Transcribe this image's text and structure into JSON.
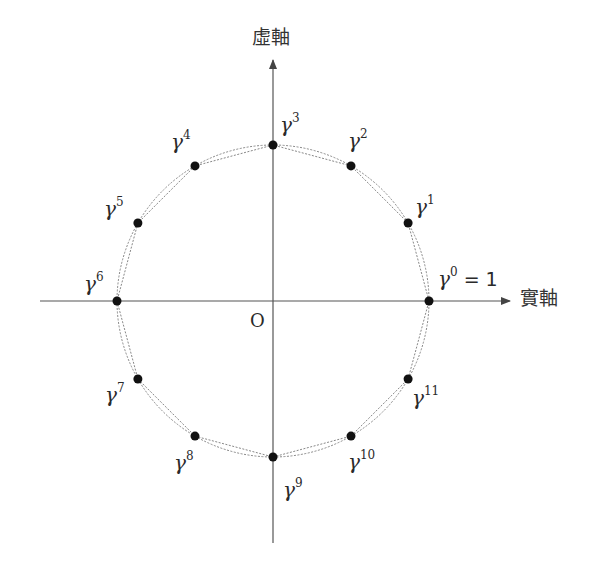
{
  "diagram": {
    "axes": {
      "imaginary_label": "虛軸",
      "real_label": "實軸",
      "origin_label": "O"
    },
    "circle": {
      "center_px": [
        273,
        301
      ],
      "radius_px": 156
    },
    "points": [
      {
        "base": "γ",
        "exp": "0",
        "suffix": " = 1",
        "angle_deg": 0
      },
      {
        "base": "γ",
        "exp": "1",
        "suffix": "",
        "angle_deg": 30
      },
      {
        "base": "γ",
        "exp": "2",
        "suffix": "",
        "angle_deg": 60
      },
      {
        "base": "γ",
        "exp": "3",
        "suffix": "",
        "angle_deg": 90
      },
      {
        "base": "γ",
        "exp": "4",
        "suffix": "",
        "angle_deg": 120
      },
      {
        "base": "γ",
        "exp": "5",
        "suffix": "",
        "angle_deg": 150
      },
      {
        "base": "γ",
        "exp": "6",
        "suffix": "",
        "angle_deg": 180
      },
      {
        "base": "γ",
        "exp": "7",
        "suffix": "",
        "angle_deg": 210
      },
      {
        "base": "γ",
        "exp": "8",
        "suffix": "",
        "angle_deg": 240
      },
      {
        "base": "γ",
        "exp": "9",
        "suffix": "",
        "angle_deg": 270
      },
      {
        "base": "γ",
        "exp": "10",
        "suffix": "",
        "angle_deg": 300
      },
      {
        "base": "γ",
        "exp": "11",
        "suffix": "",
        "angle_deg": 330
      }
    ],
    "colors": {
      "axis": "#555555",
      "point": "#111111",
      "dotted": "#888888",
      "text": "#2a2a2a"
    }
  }
}
